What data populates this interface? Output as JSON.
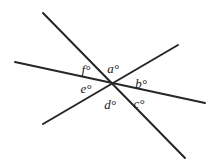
{
  "figure": {
    "type": "geometry-diagram",
    "width": 216,
    "height": 163,
    "background_color": "#ffffff",
    "line_color": "#262626",
    "line_width": 2,
    "label_color": "#1a1a1a",
    "intersection": {
      "x": 110,
      "y": 85
    },
    "lines": [
      {
        "name": "near-horizontal-line",
        "x1": 15,
        "y1": 62,
        "x2": 205,
        "y2": 103
      },
      {
        "name": "steep-falling-line",
        "x1": 43,
        "y1": 13,
        "x2": 185,
        "y2": 158
      },
      {
        "name": "rising-line",
        "x1": 43,
        "y1": 124,
        "x2": 178,
        "y2": 45
      }
    ],
    "labels": [
      {
        "name": "angle-label-a",
        "text": "a°",
        "x": 113,
        "y": 68
      },
      {
        "name": "angle-label-b",
        "text": "b°",
        "x": 141,
        "y": 83
      },
      {
        "name": "angle-label-c",
        "text": "c°",
        "x": 139,
        "y": 103
      },
      {
        "name": "angle-label-d",
        "text": "d°",
        "x": 110,
        "y": 104
      },
      {
        "name": "angle-label-e",
        "text": "e°",
        "x": 86,
        "y": 88
      },
      {
        "name": "angle-label-f",
        "text": "f°",
        "x": 86,
        "y": 69
      }
    ]
  }
}
